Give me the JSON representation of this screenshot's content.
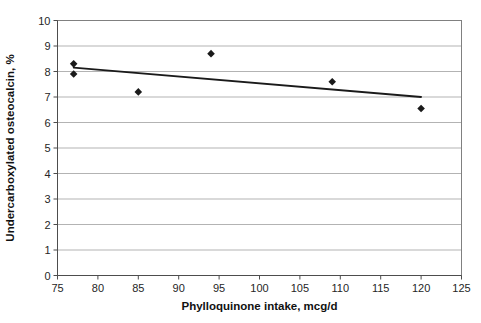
{
  "chart_data": {
    "type": "scatter",
    "title": "",
    "xlabel": "Phylloquinone intake, mcg/d",
    "ylabel": "Undercarboxylated osteocalcin, %",
    "xlim": [
      75,
      125
    ],
    "ylim": [
      0,
      10
    ],
    "xticks": [
      75,
      80,
      85,
      90,
      95,
      100,
      105,
      110,
      115,
      120,
      125
    ],
    "yticks": [
      0,
      1,
      2,
      3,
      4,
      5,
      6,
      7,
      8,
      9,
      10
    ],
    "grid": "horizontal",
    "legend": "none",
    "points": [
      {
        "x": 77,
        "y": 8.3
      },
      {
        "x": 77,
        "y": 7.9
      },
      {
        "x": 85,
        "y": 7.2
      },
      {
        "x": 94,
        "y": 8.7
      },
      {
        "x": 109,
        "y": 7.6
      },
      {
        "x": 120,
        "y": 6.55
      }
    ],
    "trendline": {
      "type": "line",
      "x": [
        77,
        120
      ],
      "y": [
        8.15,
        7.0
      ]
    },
    "marker": {
      "shape": "diamond",
      "color": "#1a1a1a",
      "size": 5
    },
    "line_color": "#1a1a1a",
    "grid_color": "#b3b3b3",
    "axis_color": "#808080",
    "background": "#ffffff"
  },
  "labels": {
    "x_tick_texts": [
      "75",
      "80",
      "85",
      "90",
      "95",
      "100",
      "105",
      "110",
      "115",
      "120",
      "125"
    ],
    "y_tick_texts": [
      "0",
      "1",
      "2",
      "3",
      "4",
      "5",
      "6",
      "7",
      "8",
      "9",
      "10"
    ]
  },
  "caption": {
    "text": ""
  }
}
